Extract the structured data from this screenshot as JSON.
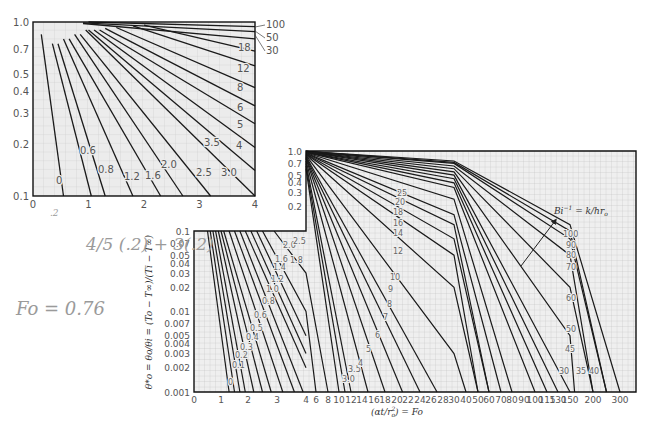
{
  "chart_data": [
    {
      "id": "small-chart",
      "type": "line",
      "title": "",
      "xlabel": "",
      "ylabel": "",
      "x_scale": "linear",
      "y_scale": "log",
      "xlim": [
        0,
        4
      ],
      "ylim": [
        0.1,
        1.0
      ],
      "x_ticks": [
        "0",
        "1",
        "2",
        "3",
        "4"
      ],
      "y_ticks": [
        "1.0",
        "0.7",
        "0.5",
        "0.4",
        "0.3",
        "0.2",
        "0.1"
      ],
      "grid": true,
      "series_labels": [
        "0",
        "0.6",
        "0.8",
        "1.2",
        "1.6",
        "2.0",
        "2.5",
        "3.0",
        "3.5",
        "4",
        "5",
        "6",
        "8",
        "12",
        "18",
        "30",
        "50",
        "100"
      ],
      "series": [
        {
          "name": "0",
          "x": [
            0.15,
            0.55
          ],
          "y": [
            0.85,
            0.1
          ]
        },
        {
          "name": "0.6",
          "x": [
            0.35,
            1.05
          ],
          "y": [
            0.75,
            0.1
          ]
        },
        {
          "name": "0.8",
          "x": [
            0.45,
            1.3
          ],
          "y": [
            0.75,
            0.1
          ]
        },
        {
          "name": "1.2",
          "x": [
            0.55,
            1.8
          ],
          "y": [
            0.8,
            0.1
          ]
        },
        {
          "name": "1.6",
          "x": [
            0.65,
            2.3
          ],
          "y": [
            0.8,
            0.1
          ]
        },
        {
          "name": "2.0",
          "x": [
            0.75,
            2.7
          ],
          "y": [
            0.85,
            0.1
          ]
        },
        {
          "name": "2.5",
          "x": [
            0.85,
            3.2
          ],
          "y": [
            0.85,
            0.1
          ]
        },
        {
          "name": "3.0",
          "x": [
            0.95,
            4.0
          ],
          "y": [
            0.9,
            0.1
          ]
        },
        {
          "name": "3.5",
          "x": [
            1.0,
            4.0
          ],
          "y": [
            0.9,
            0.14
          ]
        },
        {
          "name": "4",
          "x": [
            1.1,
            4.0
          ],
          "y": [
            0.9,
            0.19
          ]
        },
        {
          "name": "5",
          "x": [
            1.2,
            4.0
          ],
          "y": [
            0.9,
            0.26
          ]
        },
        {
          "name": "6",
          "x": [
            1.3,
            4.0
          ],
          "y": [
            0.92,
            0.33
          ]
        },
        {
          "name": "8",
          "x": [
            1.5,
            4.0
          ],
          "y": [
            0.93,
            0.42
          ]
        },
        {
          "name": "12",
          "x": [
            1.8,
            4.0
          ],
          "y": [
            0.95,
            0.56
          ]
        },
        {
          "name": "18",
          "x": [
            2.0,
            4.0
          ],
          "y": [
            0.96,
            0.68
          ]
        },
        {
          "name": "30",
          "x": [
            0.9,
            4.0
          ],
          "y": [
            0.98,
            0.8
          ]
        },
        {
          "name": "50",
          "x": [
            0.9,
            4.0
          ],
          "y": [
            0.99,
            0.88
          ]
        },
        {
          "name": "100",
          "x": [
            1.0,
            4.0
          ],
          "y": [
            1.0,
            0.94
          ]
        }
      ]
    },
    {
      "id": "heisler-chart",
      "type": "line",
      "title": "",
      "xlabel": "(αt/r_o^2) = Fo",
      "ylabel": "θ*_o = θ_o/θ_i = (T_o − T_∞)/(T_i − T_∞)",
      "x_scale": "piecewise-linear",
      "y_scale": "log",
      "ylim": [
        0.001,
        1.0
      ],
      "x_ticks": [
        "0",
        "1",
        "2",
        "3",
        "4",
        "6",
        "8",
        "10",
        "12",
        "14",
        "16",
        "18",
        "20",
        "22",
        "24",
        "26",
        "28",
        "30",
        "40",
        "50",
        "60",
        "70",
        "80",
        "90",
        "100",
        "115",
        "130",
        "150",
        "200",
        "300"
      ],
      "y_ticks_upper": [
        "1.0",
        "0.7",
        "0.5",
        "0.4",
        "0.3",
        "0.2"
      ],
      "y_ticks_lower": [
        "0.1",
        "0.07",
        "0.05",
        "0.04",
        "0.03",
        "0.02",
        "0.01",
        "0.007",
        "0.005",
        "0.004",
        "0.003",
        "0.002",
        "0.001"
      ],
      "grid": true,
      "annotation": "Bi^-1 = k/hr_o",
      "series_labels": [
        "0",
        "0.1",
        "0.2",
        "0.3",
        "0.4",
        "0.5",
        "0.6",
        "0.8",
        "1.0",
        "1.2",
        "1.4",
        "1.6",
        "1.8",
        "2.0",
        "2.5",
        "3.0",
        "3.5",
        "4",
        "5",
        "6",
        "7",
        "8",
        "9",
        "10",
        "12",
        "14",
        "16",
        "18",
        "20",
        "25",
        "30",
        "35",
        "40",
        "45",
        "50",
        "60",
        "70",
        "80",
        "90",
        "100"
      ],
      "series": [
        {
          "name": "0",
          "x": [
            0.5,
            1.3
          ],
          "y": [
            0.1,
            0.001
          ]
        },
        {
          "name": "0.1",
          "x": [
            0.6,
            1.5
          ],
          "y": [
            0.1,
            0.001
          ]
        },
        {
          "name": "0.2",
          "x": [
            0.7,
            1.7
          ],
          "y": [
            0.1,
            0.001
          ]
        },
        {
          "name": "0.3",
          "x": [
            0.8,
            1.9
          ],
          "y": [
            0.1,
            0.001
          ]
        },
        {
          "name": "0.4",
          "x": [
            0.9,
            2.2
          ],
          "y": [
            0.1,
            0.001
          ]
        },
        {
          "name": "0.5",
          "x": [
            1.0,
            2.5
          ],
          "y": [
            0.1,
            0.001
          ]
        },
        {
          "name": "0.6",
          "x": [
            1.1,
            2.8
          ],
          "y": [
            0.1,
            0.001
          ]
        },
        {
          "name": "0.8",
          "x": [
            1.3,
            3.2
          ],
          "y": [
            0.1,
            0.001
          ]
        },
        {
          "name": "1.0",
          "x": [
            1.5,
            3.6
          ],
          "y": [
            0.1,
            0.001
          ]
        },
        {
          "name": "1.2",
          "x": [
            1.7,
            3.9
          ],
          "y": [
            0.1,
            0.001
          ]
        },
        {
          "name": "1.4",
          "x": [
            1.9,
            4.0
          ],
          "y": [
            0.1,
            0.002
          ]
        },
        {
          "name": "1.6",
          "x": [
            2.1,
            4.0
          ],
          "y": [
            0.1,
            0.003
          ]
        },
        {
          "name": "1.8",
          "x": [
            2.3,
            4.0
          ],
          "y": [
            0.1,
            0.005
          ]
        },
        {
          "name": "2.0",
          "x": [
            2.5,
            4.0,
            6
          ],
          "y": [
            0.1,
            0.01,
            0.001
          ]
        },
        {
          "name": "2.5",
          "x": [
            2.9,
            4.0,
            8
          ],
          "y": [
            0.1,
            0.03,
            0.001
          ]
        },
        {
          "name": "3.0",
          "x": [
            4,
            10
          ],
          "y": [
            0.6,
            0.001
          ]
        },
        {
          "name": "3.5",
          "x": [
            4,
            11
          ],
          "y": [
            0.65,
            0.001
          ]
        },
        {
          "name": "4",
          "x": [
            4,
            12
          ],
          "y": [
            0.7,
            0.001
          ]
        },
        {
          "name": "5",
          "x": [
            4,
            15
          ],
          "y": [
            0.75,
            0.001
          ]
        },
        {
          "name": "6",
          "x": [
            4,
            18
          ],
          "y": [
            0.8,
            0.001
          ]
        },
        {
          "name": "7",
          "x": [
            4,
            21
          ],
          "y": [
            0.82,
            0.001
          ]
        },
        {
          "name": "8",
          "x": [
            4,
            24
          ],
          "y": [
            0.84,
            0.001
          ]
        },
        {
          "name": "9",
          "x": [
            4,
            27
          ],
          "y": [
            0.86,
            0.001
          ]
        },
        {
          "name": "10",
          "x": [
            4,
            30,
            40
          ],
          "y": [
            0.88,
            0.003,
            0.001
          ]
        },
        {
          "name": "12",
          "x": [
            4,
            30,
            50
          ],
          "y": [
            0.9,
            0.02,
            0.001
          ]
        },
        {
          "name": "14",
          "x": [
            4,
            30,
            50
          ],
          "y": [
            0.91,
            0.05,
            0.001
          ]
        },
        {
          "name": "16",
          "x": [
            4,
            30,
            60
          ],
          "y": [
            0.92,
            0.08,
            0.001
          ]
        },
        {
          "name": "18",
          "x": [
            4,
            30,
            60
          ],
          "y": [
            0.93,
            0.12,
            0.001
          ]
        },
        {
          "name": "20",
          "x": [
            4,
            30,
            70
          ],
          "y": [
            0.94,
            0.16,
            0.001
          ]
        },
        {
          "name": "25",
          "x": [
            4,
            30,
            80
          ],
          "y": [
            0.95,
            0.25,
            0.001
          ]
        },
        {
          "name": "30",
          "x": [
            4,
            30,
            100
          ],
          "y": [
            0.96,
            0.35,
            0.001
          ]
        },
        {
          "name": "35",
          "x": [
            4,
            30,
            115
          ],
          "y": [
            0.97,
            0.4,
            0.001
          ]
        },
        {
          "name": "40",
          "x": [
            4,
            30,
            130
          ],
          "y": [
            0.97,
            0.45,
            0.001
          ]
        },
        {
          "name": "45",
          "x": [
            4,
            30,
            150
          ],
          "y": [
            0.98,
            0.5,
            0.001
          ]
        },
        {
          "name": "50",
          "x": [
            4,
            30,
            150,
            160
          ],
          "y": [
            0.98,
            0.55,
            0.005,
            0.001
          ]
        },
        {
          "name": "60",
          "x": [
            4,
            30,
            150,
            200
          ],
          "y": [
            0.98,
            0.6,
            0.02,
            0.001
          ]
        },
        {
          "name": "70",
          "x": [
            4,
            30,
            150,
            200
          ],
          "y": [
            0.99,
            0.65,
            0.05,
            0.001
          ]
        },
        {
          "name": "80",
          "x": [
            4,
            30,
            150,
            250
          ],
          "y": [
            0.99,
            0.7,
            0.08,
            0.001
          ]
        },
        {
          "name": "90",
          "x": [
            4,
            30,
            150,
            250
          ],
          "y": [
            0.99,
            0.72,
            0.1,
            0.001
          ]
        },
        {
          "name": "100",
          "x": [
            4,
            30,
            150,
            300
          ],
          "y": [
            0.99,
            0.75,
            0.12,
            0.001
          ]
        }
      ]
    }
  ],
  "small_chart": {
    "x_ticks": [
      "0",
      "1",
      "2",
      "3",
      "4"
    ],
    "y_ticks": [
      "1.0",
      "0.7",
      "0.5",
      "0.4",
      "0.3",
      "0.2",
      "0.1"
    ],
    "right_labels": [
      "100",
      "50",
      "30"
    ],
    "inline_labels": [
      "18",
      "12",
      "8",
      "6",
      "5",
      "4",
      "3.5",
      "3.0",
      "2.5",
      "2.0",
      "1.6",
      "1.2",
      "0.8",
      "0.6",
      "0"
    ]
  },
  "big_chart": {
    "y_ticks_upper": [
      "1.0",
      "0.7",
      "0.5",
      "0.4",
      "0.3",
      "0.2"
    ],
    "y_ticks_lower": [
      "0.1",
      "0.07",
      "0.05",
      "0.04",
      "0.03",
      "0.02",
      "0.01",
      "0.007",
      "0.005",
      "0.004",
      "0.003",
      "0.002",
      "0.001"
    ],
    "x_ticks": [
      "0",
      "1",
      "2",
      "3",
      "4",
      "6",
      "8",
      "10",
      "12",
      "14",
      "16",
      "18",
      "20",
      "22",
      "24",
      "26",
      "28",
      "30",
      "40",
      "50",
      "60",
      "70",
      "80",
      "90",
      "100",
      "115",
      "130",
      "150",
      "200",
      "300"
    ],
    "xlabel": "(αt/r",
    "xlabel_sub": "o",
    "xlabel_sup": "2",
    "xlabel_tail": ") = Fo",
    "ylabel": "θ*o = θo/θi = (To − T∞)/(Ti − T∞)",
    "annotation": "Bi",
    "annotation_sup": "−1",
    "annotation_tail": " = k/hr",
    "annotation_sub": "o"
  },
  "handwriting": {
    "line1": "4/5 (.2) + 3(.2)",
    "line2": "Fo = 0.76",
    "mark": ".2"
  }
}
